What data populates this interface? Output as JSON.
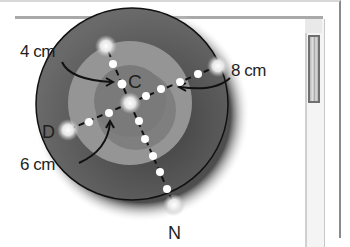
{
  "diagram": {
    "labels": {
      "inner_radius": "4 cm",
      "center": "C",
      "outer_radius": "8 cm",
      "left_point": "D",
      "middle_radius": "6 cm",
      "bottom_point": "N"
    },
    "circles": [
      {
        "name": "outer",
        "radius_label": "8 cm",
        "color": "#5c5c5c"
      },
      {
        "name": "middle",
        "radius_label": "6 cm",
        "color": "#8e8e8e"
      },
      {
        "name": "inner",
        "radius_label": "4 cm",
        "color": "#6e6e6e"
      }
    ],
    "points": [
      "C",
      "D",
      "N"
    ]
  },
  "window": {
    "scrollbar": {
      "thumb_color": "#6f6f6f"
    }
  }
}
